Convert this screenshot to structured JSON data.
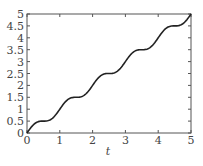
{
  "chart_data": {
    "type": "line",
    "title": "",
    "xlabel": "t",
    "ylabel": "",
    "xlim": [
      0,
      5
    ],
    "ylim": [
      0,
      5
    ],
    "grid": false,
    "legend": null,
    "x_ticks": [
      "0",
      "1",
      "2",
      "3",
      "4",
      "5"
    ],
    "y_ticks": [
      "0",
      "0.5",
      "1",
      "1.5",
      "2",
      "2.5",
      "3",
      "3.5",
      "4",
      "4.5",
      "5"
    ],
    "series": [
      {
        "name": "curve",
        "description": "staircase-like increasing curve with flat plateaus near y=0.5,1.5,2.5,3.5,4.5 (approx y = t + sin(2πt)/(2π))",
        "x": [
          0,
          0.25,
          0.5,
          0.75,
          1,
          1.25,
          1.5,
          1.75,
          2,
          2.25,
          2.5,
          2.75,
          3,
          3.25,
          3.5,
          3.75,
          4,
          4.25,
          4.5,
          4.75,
          5
        ],
        "values": [
          0,
          0.41,
          0.5,
          0.59,
          1,
          1.41,
          1.5,
          1.59,
          2,
          2.41,
          2.5,
          2.59,
          3,
          3.41,
          3.5,
          3.59,
          4,
          4.41,
          4.5,
          4.59,
          5
        ]
      }
    ],
    "color": "#222222"
  }
}
